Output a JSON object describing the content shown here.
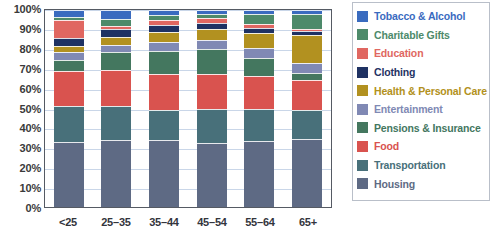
{
  "chart_data": {
    "type": "bar",
    "subtype": "stacked-percentage",
    "title": "",
    "xlabel": "",
    "ylabel": "",
    "ylim": [
      0,
      100
    ],
    "grid": true,
    "legend_position": "right",
    "categories": [
      "<25",
      "25–35",
      "35–44",
      "45–54",
      "55–64",
      "65+"
    ],
    "ytick_labels": [
      "100%",
      "90%",
      "80%",
      "70%",
      "60%",
      "50%",
      "40%",
      "30%",
      "20%",
      "10%",
      "0%"
    ],
    "ytick_values": [
      100,
      90,
      80,
      70,
      60,
      50,
      40,
      30,
      20,
      10,
      0
    ],
    "stack_order_bottom_to_top": [
      "Housing",
      "Transportation",
      "Food",
      "Pensions & Insurance",
      "Entertainment",
      "Health & Personal Care",
      "Clothing",
      "Education",
      "Charitable Gifts",
      "Tobacco & Alcohol"
    ],
    "series": [
      {
        "name": "Housing",
        "color": "#5e6a84",
        "values": [
          33.0,
          34.0,
          34.0,
          32.5,
          33.5,
          34.5
        ]
      },
      {
        "name": "Transportation",
        "color": "#48707a",
        "values": [
          18.5,
          17.5,
          15.5,
          17.5,
          16.5,
          14.5
        ]
      },
      {
        "name": "Food",
        "color": "#d9534f",
        "values": [
          17.5,
          18.0,
          18.0,
          17.5,
          16.5,
          15.5
        ]
      },
      {
        "name": "Pensions & Insurance",
        "color": "#44775f",
        "values": [
          5.5,
          9.0,
          11.5,
          12.5,
          9.0,
          3.5
        ]
      },
      {
        "name": "Entertainment",
        "color": "#8089b4",
        "values": [
          4.0,
          4.0,
          5.0,
          5.0,
          5.0,
          5.0
        ]
      },
      {
        "name": "Health & Personal Care",
        "color": "#b29120",
        "values": [
          3.5,
          4.0,
          5.0,
          5.5,
          8.0,
          14.5
        ]
      },
      {
        "name": "Clothing",
        "color": "#1f3263",
        "values": [
          4.0,
          4.0,
          3.5,
          3.0,
          2.5,
          2.0
        ]
      },
      {
        "name": "Education",
        "color": "#e06761",
        "values": [
          9.0,
          1.5,
          2.5,
          2.5,
          2.0,
          1.0
        ]
      },
      {
        "name": "Charitable Gifts",
        "color": "#4d8a6a",
        "values": [
          1.5,
          3.5,
          2.5,
          2.0,
          5.0,
          7.5
        ]
      },
      {
        "name": "Tobacco & Alcohol",
        "color": "#3a6bbf",
        "values": [
          3.5,
          4.5,
          2.5,
          2.0,
          2.0,
          2.0
        ]
      }
    ],
    "legend_entries": [
      {
        "label": "Tobacco & Alcohol",
        "color": "#3a6bbf"
      },
      {
        "label": "Charitable Gifts",
        "color": "#4d8a6a"
      },
      {
        "label": "Education",
        "color": "#e06761"
      },
      {
        "label": "Clothing",
        "color": "#1f3263"
      },
      {
        "label": "Health & Personal Care",
        "color": "#b29120"
      },
      {
        "label": "Entertainment",
        "color": "#8089b4"
      },
      {
        "label": "Pensions & Insurance",
        "color": "#44775f"
      },
      {
        "label": "Food",
        "color": "#d9534f"
      },
      {
        "label": "Transportation",
        "color": "#48707a"
      },
      {
        "label": "Housing",
        "color": "#5e6a84"
      }
    ]
  },
  "style": {
    "gridline_color": "#c9d6e8",
    "axis_color": "#555a63",
    "legend_border_color": "#b9bfc9",
    "tick_text_color": "#3a3a3a",
    "background": "#ffffff"
  }
}
